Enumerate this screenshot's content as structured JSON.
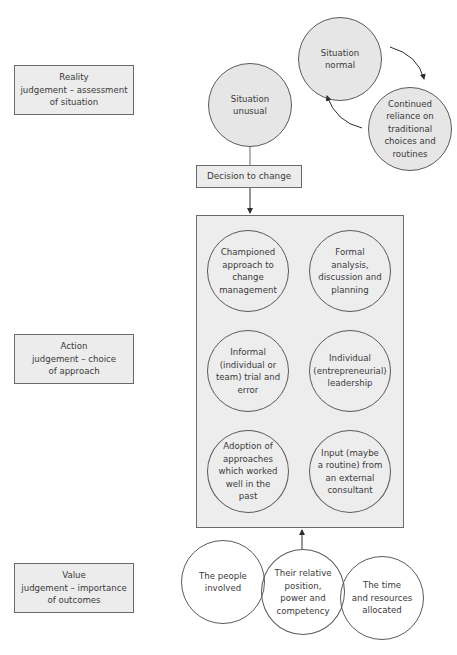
{
  "left_labels": [
    {
      "id": "reality",
      "text": "Reality\njudgement – assessment\nof situation"
    },
    {
      "id": "action",
      "text": "Action\njudgement – choice\nof approach"
    },
    {
      "id": "value",
      "text": "Value\njudgement – importance\nof outcomes"
    }
  ],
  "top_cycle": {
    "situation_normal": "Situation\nnormal",
    "continued_reliance": "Continued\nreliance on\ntraditional\nchoices and\nroutines"
  },
  "flow": {
    "situation_unusual": "Situation\nunusual",
    "decision": "Decision to change"
  },
  "approaches": [
    {
      "text": "Championed\napproach to\nchange\nmanagement"
    },
    {
      "text": "Formal\nanalysis,\ndiscussion and\nplanning"
    },
    {
      "text": "Informal\n(individual or\nteam) trial and\nerror"
    },
    {
      "text": "Individual\n(entrepreneurial)\nleadership"
    },
    {
      "text": "Adoption of\napproaches\nwhich worked\nwell in the\npast"
    },
    {
      "text": "Input (maybe\na routine) from\nan external\nconsultant"
    }
  ],
  "value_factors": [
    {
      "text": "The people\ninvolved"
    },
    {
      "text": "Their relative\nposition,\npower and\ncompetency"
    },
    {
      "text": "The time\nand resources\nallocated"
    }
  ],
  "colors": {
    "box_fill": "#ececec",
    "circle_fill": "#e6e6e6",
    "stroke": "#5a5a5a",
    "text": "#3a3a3a"
  }
}
